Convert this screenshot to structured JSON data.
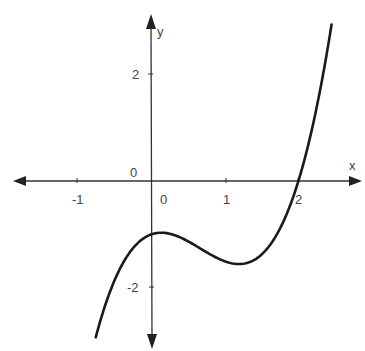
{
  "chart_data": {
    "type": "line",
    "title": "",
    "xlabel": "x",
    "ylabel": "y",
    "function": "f(x) ≈ x^3 - 2x^2 + 0.5x - 1",
    "x_ticks": [
      -1,
      0,
      1,
      2
    ],
    "x_tick_labels": [
      "-1",
      "0",
      "1",
      "2"
    ],
    "y_ticks": [
      2,
      -2
    ],
    "y_tick_labels": [
      "2",
      "-2"
    ],
    "origin_label": "0",
    "xlim": [
      -1.85,
      2.85
    ],
    "ylim": [
      -3.1,
      3.1
    ],
    "grid": false,
    "legend": null,
    "key_points": {
      "root": [
        2,
        0
      ],
      "y_intercept": [
        0,
        -1
      ],
      "local_max": [
        0.15,
        -0.97
      ],
      "local_min": [
        1.18,
        -1.5
      ]
    },
    "series": [
      {
        "name": "f(x)",
        "x": [
          -0.75,
          -0.5,
          -0.25,
          0,
          0.15,
          0.25,
          0.5,
          0.75,
          1.0,
          1.18,
          1.25,
          1.5,
          1.75,
          2.0,
          2.25,
          2.45
        ],
        "values": [
          -2.92,
          -1.875,
          -1.266,
          -1.0,
          -0.97,
          -0.98,
          -1.125,
          -1.328,
          -1.5,
          -1.55,
          -1.547,
          -1.375,
          -0.953,
          0.0,
          1.641,
          2.93
        ]
      }
    ]
  },
  "axes": {
    "x_label": "x",
    "y_label": "y",
    "origin_label": "0",
    "x_ticks": [
      {
        "value": -1,
        "label": "-1"
      },
      {
        "value": 0,
        "label": "0"
      },
      {
        "value": 1,
        "label": "1"
      },
      {
        "value": 2,
        "label": "2"
      }
    ],
    "y_ticks": [
      {
        "value": 2,
        "label": "2"
      },
      {
        "value": -2,
        "label": "-2"
      }
    ]
  },
  "colors": {
    "curve": "#1a1a1a",
    "axis": "#333333",
    "label": "#444444"
  }
}
